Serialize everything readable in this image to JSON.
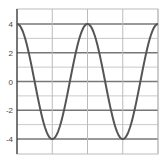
{
  "chart_data": {
    "type": "line",
    "title": "",
    "xlabel": "",
    "ylabel": "",
    "function": "y = 4cos(x)",
    "xlim": [
      0,
      12.566
    ],
    "ylim": [
      -5,
      5
    ],
    "x_ticks": [
      0,
      3.1416,
      6.2832,
      9.4248,
      12.5664
    ],
    "x_tick_labels": [],
    "y_ticks": [
      4,
      2,
      0,
      -2,
      -4
    ],
    "y_tick_labels": [
      "4",
      "2",
      "0",
      "-2",
      "-4"
    ],
    "grid": true,
    "legend": null,
    "series": [
      {
        "name": "4cos(x)",
        "color": "#555555",
        "x": [
          0,
          1.5708,
          3.1416,
          4.7124,
          6.2832,
          7.854,
          9.4248,
          10.9956,
          12.5664
        ],
        "values": [
          4,
          0,
          -4,
          0,
          4,
          0,
          -4,
          0,
          4
        ]
      }
    ]
  },
  "colors": {
    "curve": "#555555",
    "major_grid": "#777777",
    "minor_grid": "#bbbbbb",
    "axis": "#333333",
    "background": "#ffffff"
  }
}
